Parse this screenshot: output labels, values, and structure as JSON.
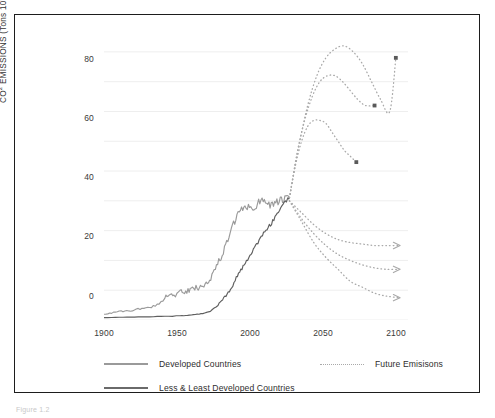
{
  "figure": {
    "caption": "Figure 1.2"
  },
  "axes": {
    "y_title_main": "CO",
    "y_title_sup1": "2",
    "y_title_mid": " EMISSIONS (Tons 10",
    "y_title_sup2": "9",
    "y_title_end": ")",
    "y_ticks": [
      "0",
      "20",
      "40",
      "60",
      "80"
    ],
    "x_ticks": [
      "1900",
      "1950",
      "2000",
      "2050",
      "2100"
    ]
  },
  "legend": {
    "items": [
      {
        "label": "Developed Countries",
        "style": "solid-light"
      },
      {
        "label": "Less & Least Developed Countries",
        "style": "solid-dark"
      },
      {
        "label": "Future Emisisons",
        "style": "dotted"
      }
    ]
  },
  "colors": {
    "developed_line": "#9a9a9a",
    "less_developed_line": "#5f5f5f",
    "future_dotted": "#a9a9a9",
    "gridline": "#eeeeee",
    "frame": "#1d1d1d",
    "text": "#333333"
  },
  "chart_data": {
    "type": "line",
    "title": "",
    "xlabel": "",
    "ylabel": "CO2 EMISSIONS (Tons 10^9)",
    "xlim": [
      1900,
      2100
    ],
    "ylim": [
      0,
      95
    ],
    "grid": true,
    "grid_y_major": [
      0,
      20,
      40,
      60,
      80
    ],
    "grid_y_minor": [
      10,
      30,
      50,
      70,
      90
    ],
    "legend_position": "below-plot",
    "series": [
      {
        "name": "Developed Countries",
        "style": "solid",
        "color": "#9a9a9a",
        "x": [
          1900,
          1905,
          1910,
          1915,
          1920,
          1925,
          1930,
          1935,
          1940,
          1943,
          1946,
          1950,
          1953,
          1956,
          1959,
          1962,
          1965,
          1968,
          1971,
          1974,
          1977,
          1980,
          1983,
          1986,
          1989,
          1992,
          1995,
          1998,
          2001,
          2004,
          2007,
          2010,
          2013,
          2016,
          2019,
          2022
        ],
        "y": [
          2.0,
          2.4,
          2.8,
          3.0,
          3.4,
          3.8,
          4.2,
          5.2,
          7.5,
          9.0,
          7.8,
          9.5,
          9.0,
          10.0,
          10.5,
          11.0,
          11.5,
          13.0,
          15.0,
          18.0,
          21.0,
          25.0,
          29.0,
          33.0,
          36.5,
          37.0,
          38.5,
          37.0,
          39.0,
          41.0,
          39.5,
          38.5,
          39.5,
          40.0,
          40.5,
          41.0
        ]
      },
      {
        "name": "Less & Least Developed Countries",
        "style": "solid",
        "color": "#5f5f5f",
        "x": [
          1900,
          1910,
          1920,
          1930,
          1940,
          1950,
          1955,
          1960,
          1965,
          1970,
          1975,
          1978,
          1981,
          1984,
          1987,
          1990,
          1993,
          1996,
          1999,
          2002,
          2005,
          2008,
          2011,
          2014,
          2017,
          2020,
          2022
        ],
        "y": [
          0.8,
          0.9,
          1.0,
          1.1,
          1.2,
          1.4,
          1.6,
          1.8,
          2.2,
          3.0,
          5.0,
          7.0,
          8.5,
          11.0,
          14.0,
          16.5,
          19.0,
          21.5,
          24.0,
          27.0,
          29.5,
          31.0,
          33.0,
          35.5,
          38.0,
          40.0,
          41.0
        ]
      },
      {
        "name": "Future Emisisons - High (upper 1)",
        "style": "dotted",
        "color": "#a9a9a9",
        "x": [
          2022,
          2028,
          2034,
          2040,
          2046,
          2052,
          2058,
          2064,
          2070,
          2076,
          2082,
          2088,
          2092
        ],
        "y": [
          41,
          58,
          72,
          82,
          88,
          91,
          92,
          90,
          86,
          80,
          74,
          70,
          88
        ]
      },
      {
        "name": "Future Emisisons - Mid (upper 2)",
        "style": "dotted",
        "color": "#a9a9a9",
        "x": [
          2022,
          2027,
          2032,
          2037,
          2042,
          2047,
          2052,
          2057,
          2062,
          2067,
          2072,
          2078
        ],
        "y": [
          41,
          56,
          67,
          75,
          80,
          82,
          82,
          80,
          77,
          74,
          72,
          72
        ]
      },
      {
        "name": "Future Emisisons - Low (upper 3)",
        "style": "dotted",
        "color": "#a9a9a9",
        "x": [
          2022,
          2026,
          2030,
          2034,
          2038,
          2042,
          2046,
          2050,
          2054,
          2058,
          2062,
          2066
        ],
        "y": [
          41,
          52,
          60,
          65,
          67,
          67,
          66,
          63,
          60,
          57,
          55,
          53
        ]
      },
      {
        "name": "Future Emisisons - Decline A (lower 1)",
        "style": "dotted",
        "color": "#a9a9a9",
        "x": [
          2022,
          2030,
          2038,
          2046,
          2054,
          2062,
          2070,
          2078,
          2086,
          2094
        ],
        "y": [
          40,
          36,
          32,
          29,
          27,
          26,
          25.5,
          25,
          25,
          25
        ]
      },
      {
        "name": "Future Emisisons - Decline B (lower 2)",
        "style": "dotted",
        "color": "#a9a9a9",
        "x": [
          2022,
          2030,
          2038,
          2046,
          2054,
          2062,
          2070,
          2078,
          2086,
          2094
        ],
        "y": [
          40,
          34,
          29,
          25,
          22,
          20,
          18.5,
          17.5,
          17,
          17
        ]
      },
      {
        "name": "Future Emisisons - Decline C (lower 3)",
        "style": "dotted",
        "color": "#a9a9a9",
        "x": [
          2022,
          2030,
          2038,
          2046,
          2054,
          2062,
          2070,
          2078,
          2086,
          2094
        ],
        "y": [
          40,
          33,
          26,
          21,
          17,
          13,
          11,
          9,
          8,
          7.5
        ]
      }
    ],
    "annotations": [
      {
        "type": "arrowhead",
        "x": 2094,
        "y": 25
      },
      {
        "type": "arrowhead",
        "x": 2094,
        "y": 17
      },
      {
        "type": "arrowhead",
        "x": 2094,
        "y": 7.5
      },
      {
        "type": "endpoint-marker",
        "x": 2092,
        "y": 88
      },
      {
        "type": "endpoint-marker",
        "x": 2078,
        "y": 72
      },
      {
        "type": "endpoint-marker",
        "x": 2066,
        "y": 53
      }
    ]
  }
}
